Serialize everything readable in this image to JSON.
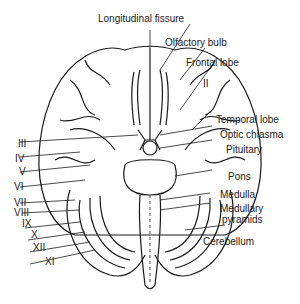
{
  "diagram": {
    "labels": {
      "longitudinal_fissure": "Longitudinal fissure",
      "olfactory_bulb": "Olfactory bulb",
      "frontal_lobe": "Frontal lobe",
      "nerve_ii": "II",
      "temporal_lobe": "Temporal lobe",
      "optic_chiasma": "Optic chiasma",
      "pituitary": "Pituitary",
      "pons": "Pons",
      "medulla": "Medulla",
      "medullary_pyramids_1": "Medullary",
      "medullary_pyramids_2": "pyramids",
      "cerebellum": "Cerebellum",
      "nerve_iii": "III",
      "nerve_iv": "IV",
      "nerve_v": "V",
      "nerve_vi": "VI",
      "nerve_vii": "VII",
      "nerve_viii": "VIII",
      "nerve_ix": "IX",
      "nerve_x": "X",
      "nerve_xii": "XII",
      "nerve_xi": "XI"
    },
    "colors": {
      "ink": "#1a1a1a",
      "background": "#ffffff"
    }
  }
}
